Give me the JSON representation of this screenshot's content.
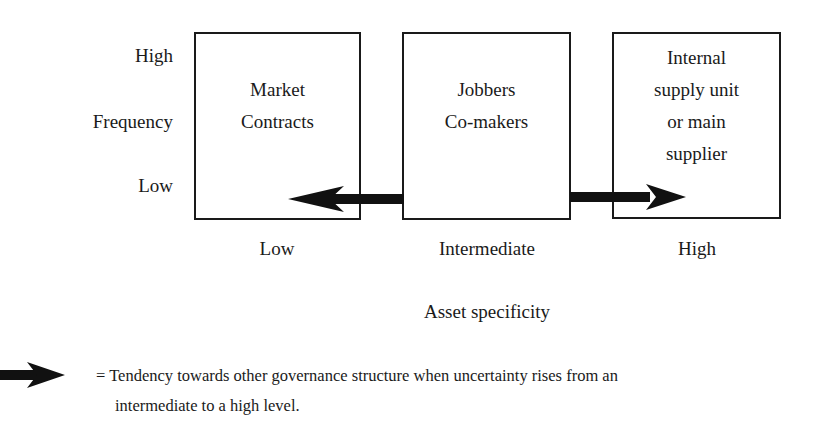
{
  "y_axis": {
    "title": "Frequency",
    "high_label": "High",
    "low_label": "Low"
  },
  "x_axis": {
    "title": "Asset specificity",
    "labels": [
      "Low",
      "Intermediate",
      "High"
    ]
  },
  "boxes": [
    {
      "lines": [
        "Market",
        "Contracts"
      ]
    },
    {
      "lines": [
        "Jobbers",
        "Co-makers"
      ]
    },
    {
      "lines": [
        "Internal",
        "supply unit",
        "or main",
        "supplier"
      ]
    }
  ],
  "arrows": [
    {
      "from": "Jobbers Co-makers",
      "to": "Market Contracts",
      "direction": "left"
    },
    {
      "from": "Jobbers Co-makers",
      "to": "Internal supply unit or main supplier",
      "direction": "right"
    }
  ],
  "legend": {
    "symbol": "arrow",
    "line1": "= Tendency towards other governance structure when uncertainty rises from an",
    "line2": "intermediate to a high level."
  }
}
